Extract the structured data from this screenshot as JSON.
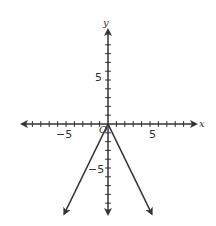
{
  "chart_data": {
    "type": "line",
    "title": "",
    "xlabel": "x",
    "ylabel": "y",
    "xlim": [
      -10,
      10
    ],
    "ylim": [
      -10,
      10
    ],
    "grid": false,
    "x_tick_labels": [
      "-5",
      "5"
    ],
    "y_tick_labels": [
      "5",
      "-5"
    ],
    "origin_label": "O",
    "series": [
      {
        "name": "y = -2|x|",
        "x": [
          -5.2,
          0,
          5.2
        ],
        "y": [
          -10.2,
          0,
          -10.2
        ]
      }
    ]
  },
  "labels": {
    "x_axis": "x",
    "y_axis": "y",
    "x_neg5": "−5",
    "x_pos5": "5",
    "y_pos5": "5",
    "y_neg5": "−5",
    "origin": "O"
  }
}
